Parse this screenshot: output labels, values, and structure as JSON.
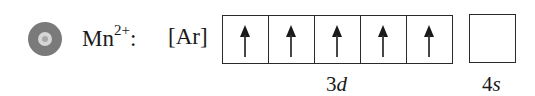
{
  "bullet": {
    "icon": "disc-bullet-icon",
    "color": "#7a7a7a"
  },
  "ion": {
    "symbol": "Mn",
    "charge": "2+",
    "suffix": ":"
  },
  "core": "[Ar]",
  "subshells": [
    {
      "n": "3",
      "l": "d",
      "orbitals": [
        "up",
        "up",
        "up",
        "up",
        "up"
      ]
    },
    {
      "n": "4",
      "l": "s",
      "orbitals": [
        "empty"
      ]
    }
  ]
}
